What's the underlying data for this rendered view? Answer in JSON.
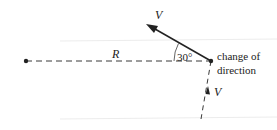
{
  "diagram": {
    "labels": {
      "velocity_out": "V",
      "velocity_in": "V",
      "radius": "R",
      "angle": "30°",
      "change_line1": "change of",
      "change_line2": "direction"
    },
    "colors": {
      "line": "#222222",
      "guide": "#e6e6e6"
    }
  }
}
